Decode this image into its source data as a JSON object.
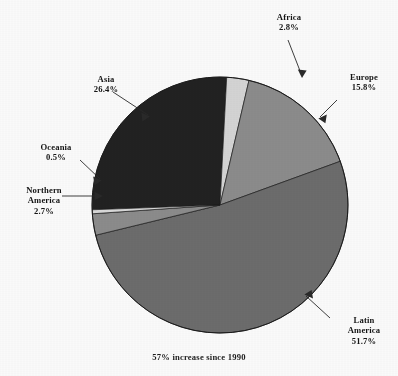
{
  "chart_data": {
    "type": "pie",
    "title": "",
    "subtitle": "",
    "footnote": "57% increase since 1990",
    "categories": [
      "Africa",
      "Europe",
      "Latin America",
      "Northern America",
      "Oceania",
      "Asia"
    ],
    "values": [
      2.8,
      15.8,
      51.7,
      2.7,
      0.5,
      26.4
    ],
    "value_labels": [
      "2.8%",
      "15.8%",
      "51.7%",
      "2.7%",
      "0.5%",
      "26.4%"
    ],
    "units": "percent",
    "start_angle_deg": -87,
    "direction": "clockwise",
    "legend": "none",
    "grid": false,
    "slice_colors": [
      "#d8d8d8",
      "#8e8e8e",
      "#6e6e6e",
      "#8e8e8e",
      "#dcdcdc",
      "#222222"
    ],
    "slices": [
      {
        "name": "Africa",
        "value": 2.8,
        "label": "2.8%",
        "color": "#d8d8d8"
      },
      {
        "name": "Europe",
        "value": 15.8,
        "label": "15.8%",
        "color": "#8e8e8e"
      },
      {
        "name": "Latin America",
        "value": 51.7,
        "label": "51.7%",
        "color": "#6e6e6e"
      },
      {
        "name": "Northern America",
        "value": 2.7,
        "label": "2.7%",
        "color": "#8e8e8e"
      },
      {
        "name": "Oceania",
        "value": 0.5,
        "label": "0.5%",
        "color": "#dcdcdc"
      },
      {
        "name": "Asia",
        "value": 26.4,
        "label": "26.4%",
        "color": "#222222"
      }
    ]
  },
  "labels": {
    "africa": {
      "name": "Africa",
      "pct": "2.8%"
    },
    "europe": {
      "name": "Europe",
      "pct": "15.8%"
    },
    "asia": {
      "name": "Asia",
      "pct": "26.4%"
    },
    "oceania": {
      "name": "Oceania",
      "pct": "0.5%"
    },
    "northern_america": {
      "name_line1": "Northern",
      "name_line2": "America",
      "pct": "2.7%"
    },
    "latin_america": {
      "name_line1": "Latin",
      "name_line2": "America",
      "pct": "51.7%"
    }
  },
  "footer": {
    "note": "57% increase since 1990"
  },
  "geometry": {
    "cx": 220,
    "cy": 205,
    "r": 128
  },
  "colors": {
    "background": "#ffffff",
    "text": "#151515",
    "leader_line": "#2a2a2a",
    "pie_outline": "#1c1c1c"
  }
}
